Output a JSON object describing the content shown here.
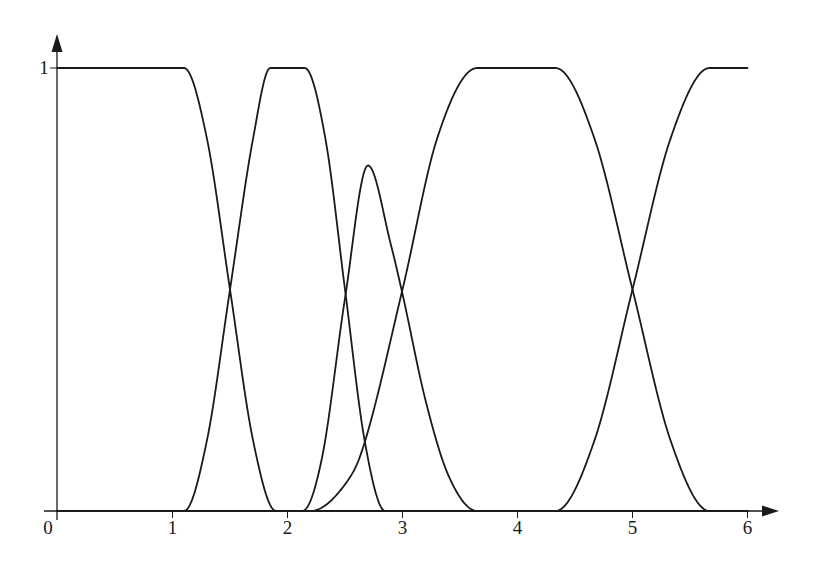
{
  "chart_data": {
    "type": "line",
    "title": "",
    "xlabel": "",
    "ylabel": "",
    "xlim": [
      0,
      6
    ],
    "ylim": [
      0,
      1
    ],
    "grid": false,
    "legend": null,
    "x_ticks": [
      {
        "value": 0,
        "label": "0"
      },
      {
        "value": 1,
        "label": "1"
      },
      {
        "value": 2,
        "label": "2"
      },
      {
        "value": 3,
        "label": "3"
      },
      {
        "value": 4,
        "label": "4"
      },
      {
        "value": 5,
        "label": "5"
      },
      {
        "value": 6,
        "label": "6"
      }
    ],
    "y_ticks": [
      {
        "value": 1,
        "label": "1"
      }
    ],
    "series": [
      {
        "name": "curve-1",
        "description": "equals 1 on [0,1.1], smooth drop to 0 by ~1.9, crosses 0.5 at x=1.5",
        "x": [
          0,
          1.1,
          1.3,
          1.5,
          1.7,
          1.9,
          6
        ],
        "y": [
          1,
          1,
          0.84,
          0.5,
          0.16,
          0,
          0
        ]
      },
      {
        "name": "curve-2",
        "description": "rises from 0 at 1.1 to 1 at ~1.85, flat until ~2.15, falls to 0 by ~2.85; crosses 0.5 at 1.5 and 2.5",
        "x": [
          0,
          1.1,
          1.3,
          1.5,
          1.7,
          1.85,
          2.15,
          2.33,
          2.5,
          2.67,
          2.85,
          6
        ],
        "y": [
          0,
          0,
          0.16,
          0.5,
          0.84,
          1,
          1,
          0.84,
          0.5,
          0.16,
          0,
          0
        ]
      },
      {
        "name": "curve-3",
        "description": "bump from ~2.13 to ~3.65, peak 0.78 at x=2.7",
        "x": [
          0,
          2.13,
          2.3,
          2.5,
          2.7,
          2.9,
          3.0,
          3.2,
          3.4,
          3.65,
          6
        ],
        "y": [
          0,
          0,
          0.12,
          0.48,
          0.78,
          0.6,
          0.49,
          0.25,
          0.08,
          0,
          0
        ]
      },
      {
        "name": "curve-4",
        "description": "rises from 0 at ~2.2 to 1 at ~3.65, flat until ~4.33, falls to 0 by ~5.67; crosses 0.5 at 3 and 5",
        "x": [
          0,
          2.2,
          2.5,
          2.64,
          3.0,
          3.3,
          3.65,
          4.33,
          4.67,
          5.0,
          5.33,
          5.67,
          6
        ],
        "y": [
          0,
          0,
          0.06,
          0.13,
          0.5,
          0.84,
          1,
          1,
          0.84,
          0.5,
          0.16,
          0,
          0
        ]
      },
      {
        "name": "curve-5",
        "description": "rises from 0 at ~4.33 to 1 at ~5.67, then flat at 1 to x=6; crosses 0.5 at 5",
        "x": [
          0,
          4.33,
          4.67,
          5.0,
          5.33,
          5.67,
          6
        ],
        "y": [
          0,
          0,
          0.16,
          0.5,
          0.84,
          1,
          1
        ]
      }
    ],
    "annotations": []
  }
}
